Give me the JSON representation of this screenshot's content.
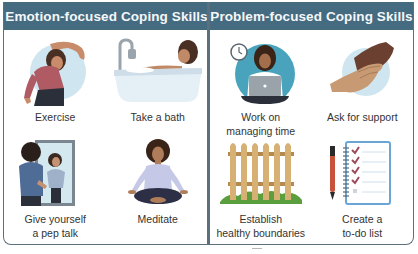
{
  "panels": [
    {
      "id": "emotion",
      "title": "Emotion-focused Coping Skills",
      "header_color": "#456b80",
      "items": [
        {
          "label": "Exercise",
          "icon": "stretching-woman-illustration"
        },
        {
          "label": "Take a bath",
          "icon": "bathtub-woman-illustration"
        },
        {
          "label": "Give yourself\na pep talk",
          "icon": "mirror-person-illustration"
        },
        {
          "label": "Meditate",
          "icon": "meditating-woman-illustration"
        }
      ]
    },
    {
      "id": "problem",
      "title": "Problem-focused Coping Skills",
      "header_color": "#456b80",
      "items": [
        {
          "label": "Work on\nmanaging time",
          "icon": "woman-laptop-clock-illustration"
        },
        {
          "label": "Ask for support",
          "icon": "holding-hands-illustration"
        },
        {
          "label": "Establish\nhealthy boundaries",
          "icon": "picket-fence-illustration"
        },
        {
          "label": "Create a\nto-do list",
          "icon": "checklist-notebook-pen-illustration"
        }
      ]
    }
  ],
  "colors": {
    "header": "#456b80",
    "border": "#5b6f7c",
    "accent_circle": "#cfe6f0",
    "teal_circle": "#4aa3bd",
    "label_text": "#333333"
  }
}
